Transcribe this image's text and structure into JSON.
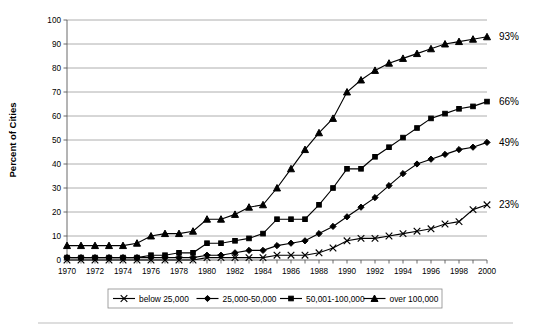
{
  "chart_data": {
    "type": "line",
    "title": "",
    "xlabel": "",
    "ylabel": "Percent of Cities",
    "ylim": [
      0,
      100
    ],
    "xlim": [
      1970,
      2000
    ],
    "ytick_step": 10,
    "xtick_step": 2,
    "grid": true,
    "legend_position": "bottom",
    "yticks": [
      0,
      10,
      20,
      30,
      40,
      50,
      60,
      70,
      80,
      90,
      100
    ],
    "xticks": [
      1970,
      1972,
      1974,
      1976,
      1978,
      1980,
      1982,
      1984,
      1986,
      1988,
      1990,
      1992,
      1994,
      1996,
      1998,
      2000
    ],
    "x": [
      1970,
      1971,
      1972,
      1973,
      1974,
      1975,
      1976,
      1977,
      1978,
      1979,
      1980,
      1981,
      1982,
      1983,
      1984,
      1985,
      1986,
      1987,
      1988,
      1989,
      1990,
      1991,
      1992,
      1993,
      1994,
      1995,
      1996,
      1997,
      1998,
      1999,
      2000
    ],
    "series": [
      {
        "name": "below 25,000",
        "marker": "x",
        "end_label": "23%",
        "values": [
          0,
          0,
          0,
          0,
          0,
          0,
          0,
          0,
          0,
          0,
          1,
          1,
          1,
          1,
          1,
          2,
          2,
          2,
          3,
          5,
          8,
          9,
          9,
          10,
          11,
          12,
          13,
          15,
          16,
          21,
          23
        ]
      },
      {
        "name": "25,000-50,000",
        "marker": "diamond",
        "end_label": "49%",
        "values": [
          1,
          1,
          1,
          1,
          1,
          1,
          1,
          1,
          1,
          1,
          2,
          2,
          3,
          4,
          4,
          6,
          7,
          8,
          11,
          14,
          18,
          22,
          26,
          31,
          36,
          40,
          42,
          44,
          46,
          47,
          49
        ]
      },
      {
        "name": "50,001-100,000",
        "marker": "square",
        "end_label": "66%",
        "values": [
          1,
          1,
          1,
          1,
          1,
          1,
          2,
          2,
          3,
          3,
          7,
          7,
          8,
          9,
          11,
          17,
          17,
          17,
          23,
          30,
          38,
          38,
          43,
          47,
          51,
          55,
          59,
          61,
          63,
          64,
          66
        ]
      },
      {
        "name": "over 100,000",
        "marker": "triangle",
        "end_label": "93%",
        "values": [
          6,
          6,
          6,
          6,
          6,
          7,
          10,
          11,
          11,
          12,
          17,
          17,
          19,
          22,
          23,
          30,
          38,
          46,
          53,
          59,
          70,
          75,
          79,
          82,
          84,
          86,
          88,
          90,
          91,
          92,
          93
        ]
      }
    ]
  },
  "axis": {
    "ylabel": "Percent of Cities"
  },
  "end_labels": [
    {
      "text": "93%",
      "value": 93
    },
    {
      "text": "66%",
      "value": 66
    },
    {
      "text": "49%",
      "value": 49
    },
    {
      "text": "23%",
      "value": 23
    }
  ],
  "legend": {
    "items": [
      {
        "label": "below 25,000",
        "marker": "x"
      },
      {
        "label": "25,000-50,000",
        "marker": "diamond"
      },
      {
        "label": "50,001-100,000",
        "marker": "square"
      },
      {
        "label": "over 100,000",
        "marker": "triangle"
      }
    ]
  }
}
